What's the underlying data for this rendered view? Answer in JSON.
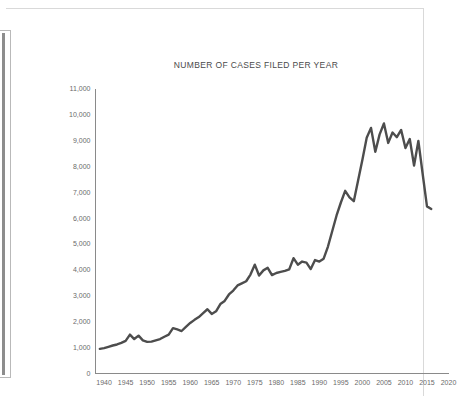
{
  "document": {
    "margin_bar_name": "binding-margin-bar"
  },
  "chart_data": {
    "type": "line",
    "title": "NUMBER OF CASES FILED PER YEAR",
    "xlabel": "",
    "ylabel": "",
    "xlim": [
      1938,
      2020
    ],
    "ylim": [
      0,
      11000
    ],
    "grid": false,
    "legend": "none",
    "line_color": "#4d4d4d",
    "axis_color": "#8a8a8a",
    "y_ticks": [
      0,
      1000,
      2000,
      3000,
      4000,
      5000,
      6000,
      7000,
      8000,
      9000,
      10000,
      11000
    ],
    "y_tick_labels": [
      "0",
      "1,000",
      "2,000",
      "3,000",
      "4,000",
      "5,000",
      "6,000",
      "7,000",
      "8,000",
      "9,000",
      "10,000",
      "11,000"
    ],
    "x_ticks": [
      1940,
      1945,
      1950,
      1955,
      1960,
      1965,
      1970,
      1975,
      1980,
      1985,
      1990,
      1995,
      2000,
      2005,
      2010,
      2015,
      2020
    ],
    "x_tick_labels": [
      "1940",
      "1945",
      "1950",
      "1955",
      "1960",
      "1965",
      "1970",
      "1975",
      "1980",
      "1985",
      "1990",
      "1995",
      "2000",
      "2005",
      "2010",
      "2015",
      "2020"
    ],
    "x": [
      1939,
      1940,
      1941,
      1942,
      1943,
      1944,
      1945,
      1946,
      1947,
      1948,
      1949,
      1950,
      1951,
      1952,
      1953,
      1954,
      1955,
      1956,
      1957,
      1958,
      1959,
      1960,
      1961,
      1962,
      1963,
      1964,
      1965,
      1966,
      1967,
      1968,
      1969,
      1970,
      1971,
      1972,
      1973,
      1974,
      1975,
      1976,
      1977,
      1978,
      1979,
      1980,
      1981,
      1982,
      1983,
      1984,
      1985,
      1986,
      1987,
      1988,
      1989,
      1990,
      1991,
      1992,
      1993,
      1994,
      1995,
      1996,
      1997,
      1998,
      1999,
      2000,
      2001,
      2002,
      2003,
      2004,
      2005,
      2006,
      2007,
      2008,
      2009,
      2010,
      2011,
      2012,
      2013,
      2014,
      2015,
      2016
    ],
    "values": [
      950,
      980,
      1030,
      1080,
      1120,
      1180,
      1260,
      1500,
      1330,
      1460,
      1280,
      1220,
      1230,
      1280,
      1330,
      1420,
      1500,
      1750,
      1700,
      1640,
      1800,
      1950,
      2070,
      2180,
      2330,
      2480,
      2300,
      2400,
      2680,
      2800,
      3050,
      3200,
      3400,
      3480,
      3560,
      3820,
      4200,
      3780,
      3980,
      4080,
      3800,
      3880,
      3920,
      3960,
      4020,
      4450,
      4200,
      4320,
      4280,
      4030,
      4380,
      4320,
      4430,
      4900,
      5500,
      6100,
      6600,
      7050,
      6800,
      6650,
      7450,
      8250,
      9100,
      9480,
      8560,
      9230,
      9650,
      8900,
      9300,
      9120,
      9400,
      8700,
      9050,
      8030,
      8980,
      7700,
      6450,
      6350
    ],
    "series": [
      {
        "name": "Cases filed",
        "values": [
          950,
          980,
          1030,
          1080,
          1120,
          1180,
          1260,
          1500,
          1330,
          1460,
          1280,
          1220,
          1230,
          1280,
          1330,
          1420,
          1500,
          1750,
          1700,
          1640,
          1800,
          1950,
          2070,
          2180,
          2330,
          2480,
          2300,
          2400,
          2680,
          2800,
          3050,
          3200,
          3400,
          3480,
          3560,
          3820,
          4200,
          3780,
          3980,
          4080,
          3800,
          3880,
          3920,
          3960,
          4020,
          4450,
          4200,
          4320,
          4280,
          4030,
          4380,
          4320,
          4430,
          4900,
          5500,
          6100,
          6600,
          7050,
          6800,
          6650,
          7450,
          8250,
          9100,
          9480,
          8560,
          9230,
          9650,
          8900,
          9300,
          9120,
          9400,
          8700,
          9050,
          8030,
          8980,
          7700,
          6450,
          6350
        ]
      }
    ]
  }
}
